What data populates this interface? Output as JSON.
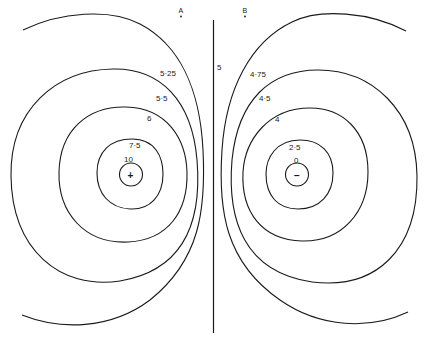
{
  "diagram": {
    "type": "equipotential-dipole",
    "stroke_color": "#1a1a1a",
    "background": "#ffffff",
    "center_line_label": "5",
    "points": [
      {
        "name": "A",
        "label": "A"
      },
      {
        "name": "B",
        "label": "B"
      }
    ],
    "charges": {
      "positive": {
        "sign": "+"
      },
      "negative": {
        "sign": "−"
      }
    },
    "left_contours": [
      {
        "value": "10"
      },
      {
        "value": "7·5"
      },
      {
        "value": "6"
      },
      {
        "value": "5·5"
      },
      {
        "value": "5·25"
      }
    ],
    "right_contours": [
      {
        "value": "0"
      },
      {
        "value": "2·5"
      },
      {
        "value": "4"
      },
      {
        "value": "4·5"
      },
      {
        "value": "4·75"
      }
    ]
  }
}
